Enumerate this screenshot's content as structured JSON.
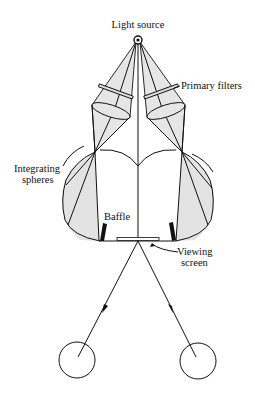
{
  "diagram": {
    "labels": {
      "light_source": "Light source",
      "primary_filters": "Primary filters",
      "integrating_spheres_line1": "Integrating",
      "integrating_spheres_line2": "spheres",
      "baffle": "Baffle",
      "viewing_screen_line1": "Viewing",
      "viewing_screen_line2": "screen"
    },
    "components": [
      "light-source",
      "primary-filters",
      "integrating-spheres",
      "baffles",
      "viewing-screen",
      "eyes"
    ],
    "colors": {
      "line": "#111111",
      "shading": "#e3e3e3",
      "background": "#ffffff"
    }
  }
}
